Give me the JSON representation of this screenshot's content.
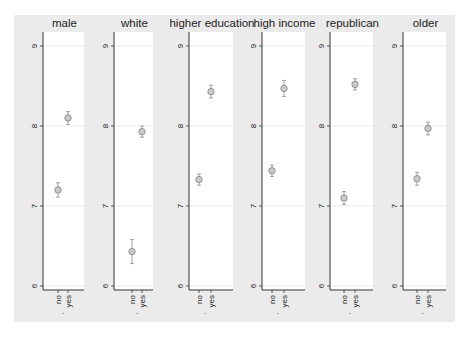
{
  "figure": {
    "background": "#ebebeb",
    "plot_background": "#ffffff",
    "axis_color": "#333333",
    "grid_color": "#e2e2e2",
    "marker_color": "#8a8a8a",
    "marker_fill": "#c9c9c9",
    "xlabel": "."
  },
  "chart_data": {
    "type": "scatter",
    "ylim": [
      6,
      9
    ],
    "yticks": [
      "6",
      "7",
      "8",
      "9"
    ],
    "grid": true,
    "categories": [
      "no",
      "yes"
    ],
    "xlabel": ".",
    "ylabel": "",
    "panels": [
      {
        "title": "male",
        "values": [
          7.2,
          8.1
        ],
        "ci_low": [
          7.11,
          8.02
        ],
        "ci_high": [
          7.29,
          8.18
        ]
      },
      {
        "title": "white",
        "values": [
          6.43,
          7.93
        ],
        "ci_low": [
          6.28,
          7.86
        ],
        "ci_high": [
          6.58,
          8.0
        ]
      },
      {
        "title": "higher education",
        "values": [
          7.33,
          8.43
        ],
        "ci_low": [
          7.26,
          8.35
        ],
        "ci_high": [
          7.4,
          8.51
        ]
      },
      {
        "title": "high income",
        "values": [
          7.44,
          8.47
        ],
        "ci_low": [
          7.37,
          8.37
        ],
        "ci_high": [
          7.51,
          8.57
        ]
      },
      {
        "title": "republican",
        "values": [
          7.1,
          8.52
        ],
        "ci_low": [
          7.02,
          8.45
        ],
        "ci_high": [
          7.18,
          8.59
        ]
      },
      {
        "title": "older",
        "values": [
          7.34,
          7.97
        ],
        "ci_low": [
          7.26,
          7.89
        ],
        "ci_high": [
          7.42,
          8.05
        ]
      }
    ]
  }
}
